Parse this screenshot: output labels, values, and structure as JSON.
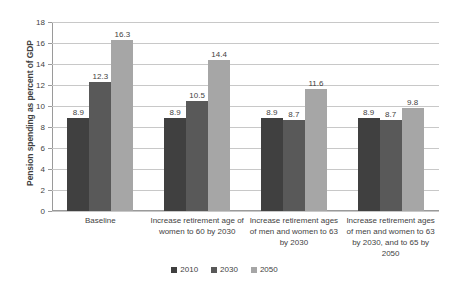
{
  "chart_data": {
    "type": "bar",
    "title": "",
    "xlabel": "",
    "ylabel": "Pension spending as percent of GDP",
    "ylim": [
      0,
      18
    ],
    "ytick_step": 2,
    "yticks": [
      18,
      16,
      14,
      12,
      10,
      8,
      6,
      4,
      2,
      0
    ],
    "grid": true,
    "legend_position": "bottom",
    "categories": [
      "Baseline",
      "Increase retirement age of women to 60 by 2030",
      "Increase retirement ages of men and women to 63 by 2030",
      "Increase retirement ages of men and women to 63 by 2030, and to 65 by 2050"
    ],
    "series": [
      {
        "name": "2010",
        "color": "#404040",
        "values": [
          8.9,
          8.9,
          8.9,
          8.9
        ]
      },
      {
        "name": "2030",
        "color": "#595959",
        "values": [
          12.3,
          10.5,
          8.7,
          8.7
        ]
      },
      {
        "name": "2050",
        "color": "#a6a6a6",
        "values": [
          16.3,
          14.4,
          11.6,
          9.8
        ]
      }
    ]
  },
  "colors": {
    "axis": "#9a9a9a",
    "gridline": "#c8c8c8",
    "text": "#3f3f3f",
    "background": "#ffffff"
  }
}
